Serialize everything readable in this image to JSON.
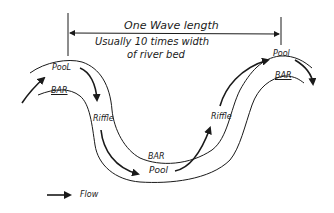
{
  "diagram": {
    "title": "One Wave length",
    "subtitle_line1": "Usually 10 times width",
    "subtitle_line2": "of river bed",
    "labels": {
      "pool_left": "PooL",
      "bar_left": "BAR",
      "riffle_left": "Riffle",
      "bar_bottom": "BAR",
      "pool_bottom": "Pool",
      "riffle_right": "Riffle",
      "pool_right": "Pool",
      "bar_right": "BAR"
    },
    "legend": {
      "icon": "arrow-right-icon",
      "label": "Flow"
    },
    "colors": {
      "ink": "#1a1a1a",
      "background": "#ffffff"
    }
  }
}
